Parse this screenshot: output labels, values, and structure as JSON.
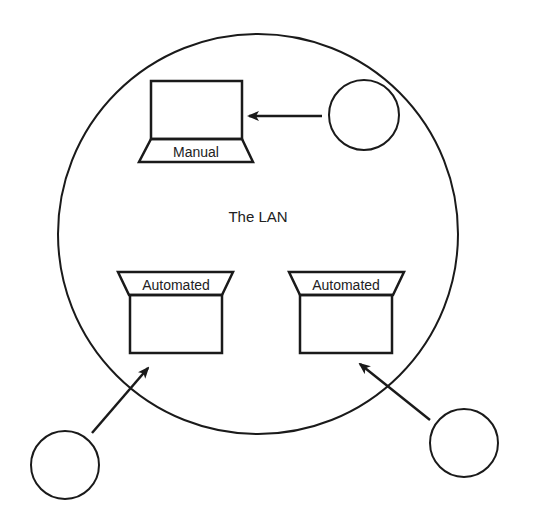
{
  "diagram": {
    "network_label": "The LAN",
    "computers": [
      {
        "id": "manual",
        "label": "Manual"
      },
      {
        "id": "auto-left",
        "label": "Automated"
      },
      {
        "id": "auto-right",
        "label": "Automated"
      }
    ],
    "external_nodes": [
      {
        "id": "top-right"
      },
      {
        "id": "bottom-left"
      },
      {
        "id": "bottom-right"
      }
    ],
    "colors": {
      "stroke": "#1a1a1a",
      "background": "#ffffff"
    }
  }
}
